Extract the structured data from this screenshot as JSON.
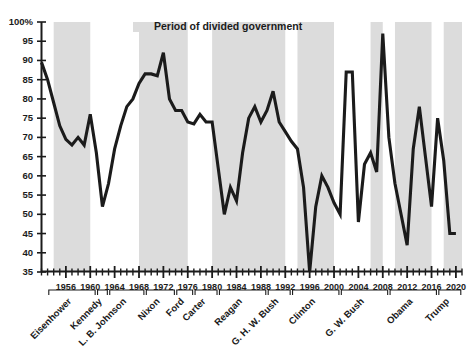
{
  "chart_data": {
    "type": "line",
    "title": "",
    "subtitle": "",
    "xlabel": "",
    "ylabel": "",
    "xlim": [
      1952,
      2021
    ],
    "ylim": [
      35,
      100
    ],
    "grid": false,
    "legend_position": "top-center",
    "legend": [
      {
        "label": "Period of divided government",
        "color": "#dcdcdc",
        "type": "band"
      }
    ],
    "yticks": [
      35,
      40,
      45,
      50,
      55,
      60,
      65,
      70,
      75,
      80,
      85,
      90,
      95,
      100
    ],
    "ytick_labels": [
      "35",
      "40",
      "45",
      "50",
      "55",
      "60",
      "65",
      "70",
      "75",
      "80",
      "85",
      "90",
      "95",
      "100%"
    ],
    "xticks": [
      1956,
      1960,
      1964,
      1968,
      1972,
      1976,
      1980,
      1984,
      1988,
      1992,
      1996,
      2000,
      2004,
      2008,
      2012,
      2016,
      2020
    ],
    "xtick_labels": [
      "1956",
      "1960",
      "1964",
      "1968",
      "1972",
      "1976",
      "1980",
      "1984",
      "1988",
      "1992",
      "1996",
      "2000",
      "2004",
      "2008",
      "2012",
      "2016",
      "2020"
    ],
    "minor_tick_interval": 1,
    "series": [
      {
        "name": "Percent",
        "color": "#1b1b1b",
        "x": [
          1952,
          1953,
          1954,
          1955,
          1956,
          1957,
          1958,
          1959,
          1960,
          1961,
          1962,
          1963,
          1964,
          1965,
          1966,
          1967,
          1968,
          1969,
          1970,
          1971,
          1972,
          1973,
          1974,
          1975,
          1976,
          1977,
          1978,
          1979,
          1980,
          1981,
          1982,
          1983,
          1984,
          1985,
          1986,
          1987,
          1988,
          1989,
          1990,
          1991,
          1992,
          1993,
          1994,
          1995,
          1996,
          1997,
          1998,
          1999,
          2000,
          2001,
          2002,
          2003,
          2004,
          2005,
          2006,
          2007,
          2008,
          2009,
          2010,
          2011,
          2012,
          2013,
          2014,
          2015,
          2016,
          2017,
          2018,
          2019,
          2020
        ],
        "y": [
          89.5,
          85.0,
          79.0,
          73.0,
          69.5,
          68.0,
          70.0,
          68.0,
          76.0,
          66.0,
          52.0,
          58.0,
          67.0,
          73.0,
          78.0,
          80.0,
          84.0,
          86.5,
          86.5,
          86.0,
          92.0,
          80.0,
          77.0,
          77.0,
          74.0,
          73.5,
          76.0,
          74.0,
          74.0,
          62.0,
          50.0,
          57.0,
          53.5,
          66.0,
          75.0,
          78.0,
          74.0,
          77.0,
          82.0,
          74.0,
          71.5,
          69.0,
          67.0,
          57.0,
          35.0,
          52.0,
          60.0,
          57.0,
          53.0,
          50.0,
          87.0,
          87.0,
          48.0,
          63.0,
          66.0,
          61.0,
          97.0,
          70.0,
          58.0,
          50.0,
          42.0,
          67.0,
          78.0,
          65.0,
          52.0,
          75.0,
          64.0,
          45.0,
          45.0
        ]
      }
    ],
    "divided_government_bands": [
      {
        "start": 1954,
        "end": 1960
      },
      {
        "start": 1968,
        "end": 1976
      },
      {
        "start": 1980,
        "end": 1992
      },
      {
        "start": 1994,
        "end": 2000
      },
      {
        "start": 2006,
        "end": 2008
      },
      {
        "start": 2010,
        "end": 2016
      },
      {
        "start": 2018,
        "end": 2021
      }
    ],
    "presidents": [
      {
        "name": "Eisenhower",
        "start": 1953,
        "end": 1961
      },
      {
        "name": "Kennedy",
        "start": 1961,
        "end": 1963
      },
      {
        "name": "L. B. Johnson",
        "start": 1963,
        "end": 1969
      },
      {
        "name": "Nixon",
        "start": 1969,
        "end": 1974
      },
      {
        "name": "Ford",
        "start": 1974,
        "end": 1977
      },
      {
        "name": "Carter",
        "start": 1977,
        "end": 1981
      },
      {
        "name": "Reagan",
        "start": 1981,
        "end": 1989
      },
      {
        "name": "G. H. W. Bush",
        "start": 1989,
        "end": 1993
      },
      {
        "name": "Clinton",
        "start": 1993,
        "end": 2001
      },
      {
        "name": "G. W. Bush",
        "start": 2001,
        "end": 2009
      },
      {
        "name": "Obama",
        "start": 2009,
        "end": 2017
      },
      {
        "name": "Trump",
        "start": 2017,
        "end": 2021
      }
    ]
  },
  "colors": {
    "band": "#dcdcdc",
    "line": "#1b1b1b",
    "axis": "#1b1b1b",
    "text": "#1b1b1b",
    "background": "#ffffff"
  }
}
